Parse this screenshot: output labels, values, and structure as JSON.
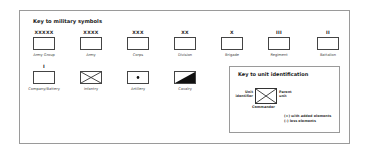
{
  "key_military": {
    "title": "Key to military symbols",
    "row1": [
      {
        "echelon": "XXXXX",
        "label": "Army Group"
      },
      {
        "echelon": "XXXX",
        "label": "Army"
      },
      {
        "echelon": "XXX",
        "label": "Corps"
      },
      {
        "echelon": "XX",
        "label": "Division"
      },
      {
        "echelon": "X",
        "label": "Brigade"
      },
      {
        "echelon": "III",
        "label": "Regiment"
      },
      {
        "echelon": "II",
        "label": "Battalion"
      }
    ],
    "row2": [
      {
        "echelon": "I",
        "label": "Company/Battery",
        "icon": "plain-box-icon"
      },
      {
        "echelon": "",
        "label": "Infantry",
        "icon": "infantry-cross-icon"
      },
      {
        "echelon": "",
        "label": "Artillery",
        "icon": "artillery-dot-icon"
      },
      {
        "echelon": "",
        "label": "Cavalry",
        "icon": "cavalry-diagonal-icon"
      }
    ]
  },
  "key_unit_id": {
    "title": "Key to unit identification",
    "unit_identifier": "Unit\nidentifier",
    "unit_identifier_line1": "Unit",
    "unit_identifier_line2": "identifier",
    "parent_unit_line1": "Parent",
    "parent_unit_line2": "unit",
    "commander": "Commander",
    "note_plus": "(+) with added elements",
    "note_minus": "(-) less elements"
  }
}
